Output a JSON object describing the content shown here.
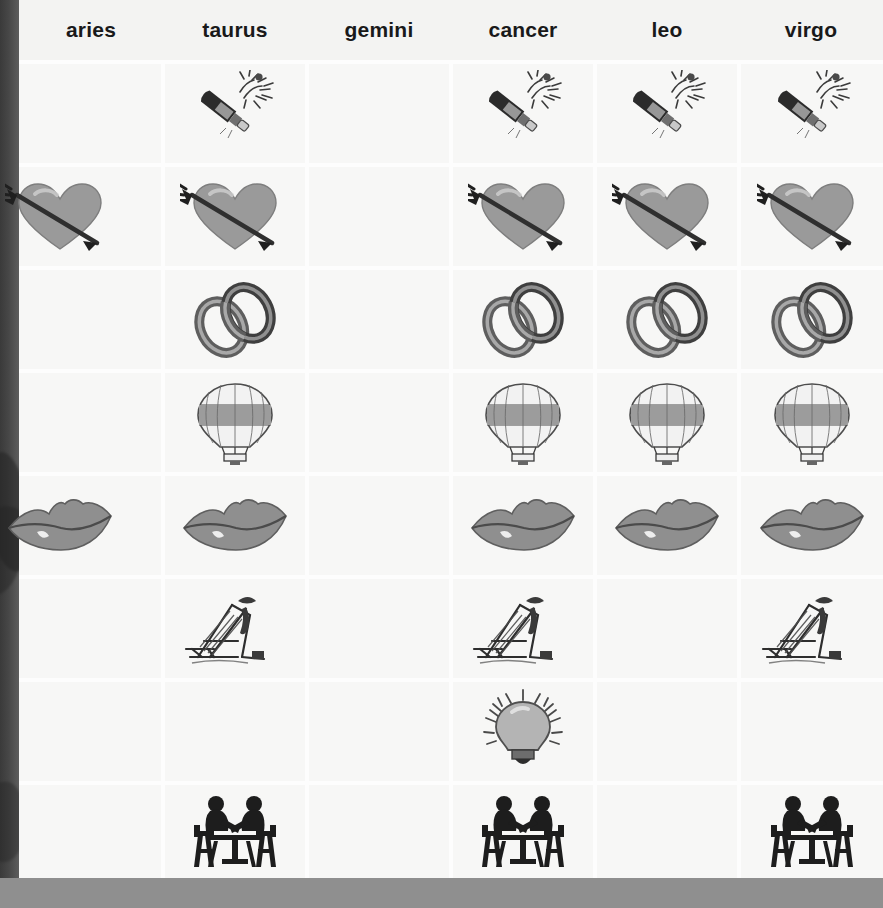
{
  "sheet": {
    "background_color": "#f3f3f2",
    "gutter_color": "#474747",
    "footer_band_color": "#8f8f8f",
    "cell_color": "#f7f7f6",
    "grid_line_color": "#fdfdfd"
  },
  "columns": [
    {
      "label": "aries"
    },
    {
      "label": "taurus"
    },
    {
      "label": "gemini"
    },
    {
      "label": "cancer"
    },
    {
      "label": "leo"
    },
    {
      "label": "virgo"
    }
  ],
  "icon_names": {
    "champagne": "champagne-bottle-icon",
    "heart_arrow": "heart-with-arrow-icon",
    "rings": "interlocking-rings-icon",
    "balloon": "hot-air-balloon-icon",
    "lips": "lips-kiss-icon",
    "deckchair": "deck-chair-icon",
    "bulb": "light-bulb-icon",
    "dinner": "two-people-at-table-icon"
  },
  "rows": [
    {
      "symbol": "champagne",
      "cells": [
        false,
        true,
        false,
        true,
        true,
        true
      ]
    },
    {
      "symbol": "heart_arrow",
      "cells": [
        true,
        true,
        false,
        true,
        true,
        true
      ]
    },
    {
      "symbol": "rings",
      "cells": [
        false,
        true,
        false,
        true,
        true,
        true
      ]
    },
    {
      "symbol": "balloon",
      "cells": [
        false,
        true,
        false,
        true,
        true,
        true
      ]
    },
    {
      "symbol": "lips",
      "cells": [
        true,
        true,
        false,
        true,
        true,
        true
      ]
    },
    {
      "symbol": "deckchair",
      "cells": [
        false,
        true,
        false,
        true,
        false,
        true
      ]
    },
    {
      "symbol": "bulb",
      "cells": [
        false,
        false,
        false,
        true,
        false,
        false
      ]
    },
    {
      "symbol": "dinner",
      "cells": [
        false,
        true,
        false,
        true,
        false,
        true
      ]
    }
  ],
  "symbol_colors": {
    "heart_fill": "#9a9a9a",
    "lips_fill": "#8f8f8f",
    "bulb_fill": "#b4b4b4",
    "rings_fill": "#7b7b7b",
    "balloon_band": "#9c9c9c",
    "silhouette": "#1d1d1d"
  }
}
